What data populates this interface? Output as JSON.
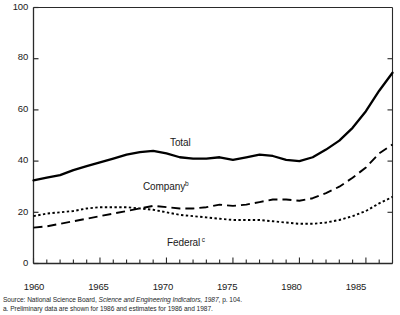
{
  "chart_data": {
    "type": "line",
    "title": "",
    "xlabel": "",
    "ylabel": "",
    "xlim": [
      1960,
      1987
    ],
    "ylim": [
      0,
      100
    ],
    "grid": false,
    "legend_position": "inline-annotations",
    "y_ticks": [
      0,
      20,
      40,
      60,
      80,
      100
    ],
    "x_ticks_labeled": [
      1960,
      1965,
      1970,
      1975,
      1980,
      1985
    ],
    "x_ticks_minor_interval": 1,
    "x": [
      1960,
      1961,
      1962,
      1963,
      1964,
      1965,
      1966,
      1967,
      1968,
      1969,
      1970,
      1971,
      1972,
      1973,
      1974,
      1975,
      1976,
      1977,
      1978,
      1979,
      1980,
      1981,
      1982,
      1983,
      1984,
      1985,
      1986,
      1987
    ],
    "series": [
      {
        "name": "Total",
        "style": "solid",
        "color": "#000000",
        "values": [
          32.5,
          33.5,
          34.5,
          36.5,
          38.0,
          39.5,
          41.0,
          42.5,
          43.5,
          44.0,
          43.0,
          41.5,
          41.0,
          41.0,
          41.5,
          40.5,
          41.5,
          42.5,
          42.0,
          40.5,
          40.0,
          41.5,
          44.5,
          48.0,
          53.0,
          59.5,
          67.5,
          74.5
        ]
      },
      {
        "name": "Company",
        "footnote_marker": "b",
        "style": "dashed",
        "color": "#000000",
        "values": [
          14.0,
          14.5,
          15.5,
          16.5,
          17.5,
          18.5,
          19.5,
          20.5,
          21.5,
          22.5,
          22.0,
          21.5,
          21.5,
          22.0,
          23.0,
          22.5,
          23.0,
          24.0,
          25.0,
          25.0,
          24.5,
          25.5,
          27.5,
          30.0,
          33.5,
          37.5,
          43.0,
          46.5
        ]
      },
      {
        "name": "Federal",
        "footnote_marker": "c",
        "style": "dotted",
        "color": "#000000",
        "values": [
          18.5,
          19.5,
          20.0,
          20.5,
          21.5,
          22.0,
          22.0,
          22.0,
          21.5,
          21.0,
          20.0,
          19.0,
          18.5,
          18.0,
          17.5,
          17.0,
          17.0,
          17.0,
          16.5,
          16.0,
          15.5,
          15.5,
          16.0,
          17.0,
          18.5,
          20.5,
          23.5,
          26.0
        ]
      }
    ]
  },
  "axes": {
    "y_tick_labels": [
      "0",
      "20",
      "40",
      "60",
      "80",
      "100"
    ],
    "x_tick_labels": [
      "1960",
      "1965",
      "1970",
      "1975",
      "1980",
      "1985"
    ]
  },
  "annotations": {
    "total": {
      "label": "Total"
    },
    "company": {
      "label": "Company",
      "marker": "b"
    },
    "federal": {
      "label": "Federal",
      "marker": "c"
    }
  },
  "notes": {
    "source_prefix": "Source: National Science Board, ",
    "source_italic": "Science and Engineering Indicators, 1987",
    "source_suffix": ", p. 104.",
    "footnote_b": "a. Preliminary data are shown for 1986 and estimates for 1986 and 1987."
  }
}
